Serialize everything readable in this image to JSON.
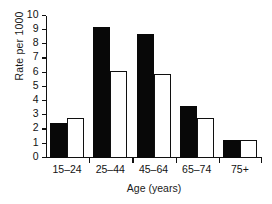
{
  "chart_data": {
    "type": "bar",
    "title": "",
    "subtitle": "",
    "xlabel": "Age (years)",
    "ylabel": "Rate per 1000",
    "categories": [
      "15–24",
      "25–44",
      "45–64",
      "65–74",
      "75+"
    ],
    "series": [
      {
        "name": "filled",
        "style": "solid-black",
        "color": "#080808",
        "values": [
          2.45,
          9.2,
          8.7,
          3.65,
          1.3
        ]
      },
      {
        "name": "open",
        "style": "open-white",
        "color": "#ffffff",
        "edge_color": "#101010",
        "values": [
          2.85,
          6.1,
          5.95,
          2.85,
          1.3
        ]
      }
    ],
    "ylim": [
      0,
      10
    ],
    "ytick_labels": [
      "0",
      "1",
      "2",
      "3",
      "4",
      "5",
      "6",
      "7",
      "8",
      "9",
      "10"
    ],
    "ytick_values": [
      0,
      1,
      2,
      3,
      4,
      5,
      6,
      7,
      8,
      9,
      10
    ],
    "grid": false,
    "legend": "none",
    "legend_position": "none",
    "axis_color": "#111111",
    "background_color": "#ffffff"
  }
}
